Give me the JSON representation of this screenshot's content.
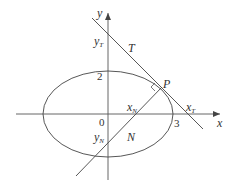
{
  "diagram": {
    "type": "ellipse-tangent-normal",
    "colors": {
      "stroke": "#444444",
      "text": "#333333",
      "background": "#ffffff"
    },
    "axes": {
      "x_label": "x",
      "y_label": "y",
      "origin_label": "0"
    },
    "ellipse": {
      "semi_major_label": "3",
      "semi_minor_label": "2"
    },
    "point": {
      "label": "P"
    },
    "tangent": {
      "label": "T",
      "x_intercept_label": "x",
      "x_intercept_sub": "T",
      "y_intercept_label": "y",
      "y_intercept_sub": "T"
    },
    "normal": {
      "label": "N",
      "x_intercept_label": "x",
      "x_intercept_sub": "N",
      "y_intercept_label": "y",
      "y_intercept_sub": "N"
    }
  }
}
